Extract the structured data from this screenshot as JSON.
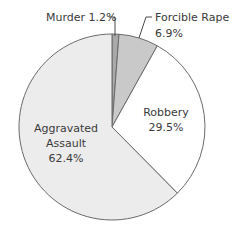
{
  "chart_data": {
    "type": "pie",
    "title": "",
    "start_angle_deg": 0,
    "direction": "clockwise",
    "center": [
      112,
      127
    ],
    "radius": 93,
    "slices": [
      {
        "label": "Murder",
        "value": 1.2,
        "display": "Murder 1.2%",
        "color": "#a9a9a9"
      },
      {
        "label": "Forcible Rape",
        "value": 6.9,
        "display": "Forcible Rape 6.9%",
        "color": "#c9c9c9"
      },
      {
        "label": "Robbery",
        "value": 29.5,
        "display": "Robbery 29.5%",
        "color": "#ffffff"
      },
      {
        "label": "Aggravated Assault",
        "value": 62.4,
        "display": "Aggravated Assault 62.4%",
        "color": "#ececec"
      }
    ],
    "categories": [
      "Murder",
      "Forcible Rape",
      "Robbery",
      "Aggravated Assault"
    ],
    "values": [
      1.2,
      6.9,
      29.5,
      62.4
    ],
    "unit": "%",
    "legend": "none (direct labels)"
  },
  "labels": {
    "murder": {
      "line1": "Murder 1.2%"
    },
    "rape": {
      "line1": "Forcible Rape",
      "line2": "6.9%"
    },
    "robbery": {
      "line1": "Robbery",
      "line2": "29.5%"
    },
    "assault": {
      "line1": "Aggravated",
      "line2": "Assault",
      "line3": "62.4%"
    }
  },
  "style": {
    "outline_color": "#6a6a6a",
    "text_color": "#3a3a3a"
  }
}
